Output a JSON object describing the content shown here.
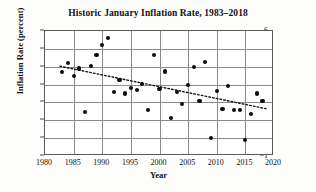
{
  "chart_data": {
    "type": "scatter",
    "title": "Historic January Inflation Rate, 1983–2018",
    "xlabel": "Year",
    "ylabel": "Inflation Rate (percent)",
    "xlim": [
      1980,
      2020
    ],
    "ylim": [
      -1,
      6
    ],
    "xticks": [
      1980,
      1985,
      1990,
      1995,
      2000,
      2005,
      2010,
      2015,
      2020
    ],
    "yticks": [
      -1,
      0,
      1,
      2,
      3,
      4,
      5,
      6
    ],
    "xtick_labels": [
      "1980",
      "1985",
      "1990",
      "1995",
      "2000",
      "2005",
      "2010",
      "2015",
      "2020"
    ],
    "ytick_labels": [
      "−1",
      "0",
      "1",
      "2",
      "3",
      "4",
      "5",
      "6"
    ],
    "grid": true,
    "legend": "none",
    "marker_color": "#0b0b0b",
    "trend_color": "#111111",
    "x": [
      1983,
      1984,
      1985,
      1986,
      1987,
      1988,
      1989,
      1990,
      1991,
      1992,
      1993,
      1994,
      1995,
      1996,
      1997,
      1998,
      1999,
      2000,
      2001,
      2002,
      2003,
      2004,
      2005,
      2006,
      2007,
      2008,
      2009,
      2010,
      2011,
      2012,
      2013,
      2014,
      2015,
      2016,
      2017,
      2018
    ],
    "y": [
      3.7,
      4.2,
      3.5,
      3.9,
      1.45,
      4.05,
      4.67,
      5.2,
      5.6,
      2.6,
      3.25,
      2.5,
      2.8,
      2.7,
      3.05,
      1.57,
      4.67,
      2.75,
      3.73,
      1.14,
      2.6,
      1.93,
      2.97,
      4.0,
      2.08,
      4.28,
      0.03,
      2.65,
      1.63,
      2.93,
      1.59,
      1.58,
      -0.09,
      1.37,
      2.5,
      2.07
    ],
    "series_name": "January inflation rate",
    "trend": {
      "type": "linear",
      "style": "dotted",
      "x_start": 1982.6,
      "y_start": 4.03,
      "x_end": 2018.6,
      "y_end": 1.65,
      "slope_per_year": -0.066,
      "description": "dotted least-squares trend line decreasing from about 4.0 percent in 1983 to about 1.65 percent in 2018"
    }
  }
}
